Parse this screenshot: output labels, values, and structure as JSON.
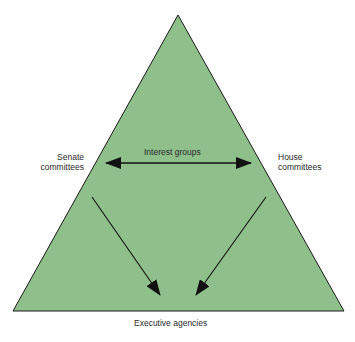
{
  "diagram": {
    "fill_color": "#8fbf8a",
    "stroke_color": "#1a1a1a",
    "nodes": {
      "top_left": "Senate committees",
      "top_left_lines": [
        "Senate",
        "committees"
      ],
      "top_right": "House committees",
      "top_right_lines": [
        "House",
        "committees"
      ],
      "center": "Interest groups",
      "bottom": "Executive agencies"
    },
    "edges": [
      {
        "from": "Senate committees",
        "to": "House committees",
        "type": "bidirectional",
        "label": "Interest groups"
      },
      {
        "from": "Senate committees",
        "to": "Executive agencies",
        "type": "directed"
      },
      {
        "from": "House committees",
        "to": "Executive agencies",
        "type": "directed"
      }
    ]
  }
}
